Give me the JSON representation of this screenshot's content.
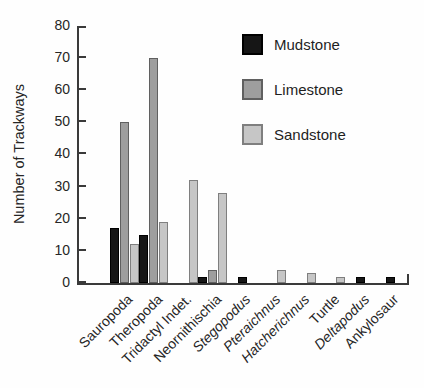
{
  "chart_data": {
    "type": "bar",
    "title": "",
    "ylabel": "Number of Trackways",
    "xlabel": "",
    "ylim": [
      0,
      80
    ],
    "yticks": [
      0,
      10,
      20,
      30,
      40,
      50,
      60,
      70,
      80
    ],
    "grid": false,
    "legend_position": "upper-right",
    "axis_color": "#3a3a3a",
    "legend": [
      {
        "name": "Mudstone",
        "color": "#161616",
        "border": "#000000"
      },
      {
        "name": "Limestone",
        "color": "#9e9e9e",
        "border": "#606060"
      },
      {
        "name": "Sandstone",
        "color": "#c6c6c6",
        "border": "#7f7f7f"
      }
    ],
    "categories": [
      {
        "label": "Sauropoda",
        "italic": false
      },
      {
        "label": "Theropoda",
        "italic": false
      },
      {
        "label": "Tridactyl Indet.",
        "italic": false
      },
      {
        "label": "Neornithischia",
        "italic": false
      },
      {
        "label": "Stegopodus",
        "italic": true
      },
      {
        "label": "Pteraichnus",
        "italic": true
      },
      {
        "label": "Hatcherichnus",
        "italic": true
      },
      {
        "label": "Turtle",
        "italic": false
      },
      {
        "label": "Deltapodus",
        "italic": true
      },
      {
        "label": "Ankylosaur",
        "italic": false
      }
    ],
    "series": [
      {
        "name": "Mudstone",
        "values": [
          17,
          15,
          null,
          2,
          2,
          null,
          null,
          null,
          2,
          2
        ]
      },
      {
        "name": "Limestone",
        "values": [
          50,
          70,
          null,
          4,
          null,
          null,
          null,
          null,
          null,
          null
        ]
      },
      {
        "name": "Sandstone",
        "values": [
          12,
          19,
          32,
          28,
          null,
          4,
          3,
          2,
          null,
          null
        ]
      }
    ]
  }
}
